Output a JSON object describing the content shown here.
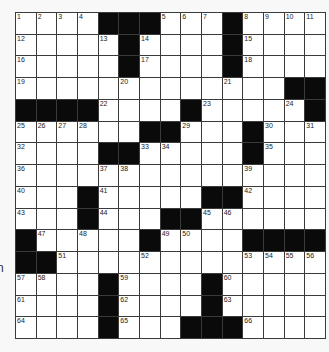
{
  "puzzle": {
    "type": "crossword",
    "rows": 15,
    "cols": 15,
    "edge_fragment_text": "n",
    "colors": {
      "black_square": "#0a0a0a",
      "white_square": "#ffffff",
      "grid_line": "#3a3a3a",
      "background": "#f8f8f8"
    },
    "grid": [
      [
        "1",
        "2",
        "3",
        "4",
        "#",
        "#",
        "#",
        "5",
        "6",
        "7",
        "#",
        "8",
        "9",
        "10",
        "11"
      ],
      [
        "12",
        "",
        "",
        "",
        "13",
        "#",
        "14",
        "",
        "",
        "",
        "#",
        "15",
        "",
        "",
        ""
      ],
      [
        "16",
        "",
        "",
        "",
        "",
        "#",
        "17",
        "",
        "",
        "",
        "#",
        "18",
        "",
        "",
        ""
      ],
      [
        "19",
        "",
        "",
        "",
        "",
        "20",
        "",
        "",
        "",
        "",
        "21",
        "",
        "",
        "#",
        "#"
      ],
      [
        "#",
        "#",
        "#",
        "#",
        "22",
        "",
        "",
        "",
        "#",
        "23",
        "",
        "",
        "",
        "24",
        "#"
      ],
      [
        "25",
        "26",
        "27",
        "28",
        "",
        "",
        "#",
        "#",
        "29",
        "",
        "",
        "#",
        "30",
        "",
        "31"
      ],
      [
        "32",
        "",
        "",
        "",
        "#",
        "#",
        "33",
        "34",
        "",
        "",
        "",
        "#",
        "35",
        "",
        ""
      ],
      [
        "36",
        "",
        "",
        "",
        "37",
        "38",
        "",
        "",
        "",
        "",
        "",
        "39",
        "",
        "",
        ""
      ],
      [
        "40",
        "",
        "",
        "#",
        "41",
        "",
        "",
        "",
        "",
        "#",
        "#",
        "42",
        "",
        "",
        ""
      ],
      [
        "43",
        "",
        "",
        "#",
        "44",
        "",
        "",
        "#",
        "#",
        "45",
        "46",
        "",
        "",
        "",
        ""
      ],
      [
        "#",
        "47",
        "",
        "48",
        "",
        "",
        "#",
        "49",
        "50",
        "",
        "",
        "#",
        "#",
        "#",
        "#"
      ],
      [
        "#",
        "#",
        "51",
        "",
        "",
        "",
        "52",
        "",
        "",
        "",
        "",
        "53",
        "54",
        "55",
        "56"
      ],
      [
        "57",
        "58",
        "",
        "",
        "#",
        "59",
        "",
        "",
        "",
        "#",
        "60",
        "",
        "",
        "",
        ""
      ],
      [
        "61",
        "",
        "",
        "",
        "#",
        "62",
        "",
        "",
        "",
        "#",
        "63",
        "",
        "",
        "",
        ""
      ],
      [
        "64",
        "",
        "",
        "",
        "#",
        "65",
        "",
        "",
        "#",
        "#",
        "#",
        "66",
        "",
        "",
        ""
      ]
    ]
  }
}
